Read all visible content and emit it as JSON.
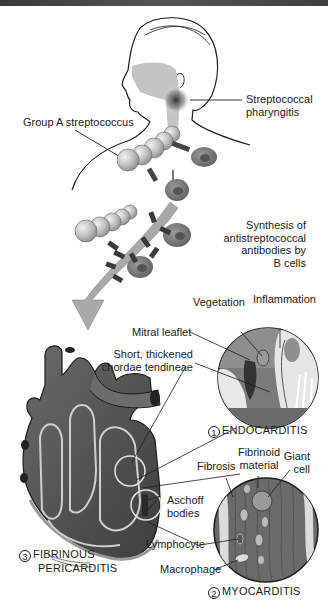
{
  "figure": {
    "topic": "Pathogenesis of rheumatic heart disease",
    "labels": {
      "strep_pharyngitis_line1": "Streptococcal",
      "strep_pharyngitis_line2": "pharyngitis",
      "group_a_strep": "Group A streptococcus",
      "synthesis_line1": "Synthesis of",
      "synthesis_line2": "antistreptococcal",
      "synthesis_line3": "antibodies by",
      "synthesis_line4": "B cells",
      "vegetation": "Vegetation",
      "inflammation": "Inflammation",
      "mitral_leaflet": "Mitral leaflet",
      "chordae_line1": "Short, thickened",
      "chordae_line2": "chordae tendineae",
      "fibrosis": "Fibrosis",
      "fibrinoid_line1": "Fibrinoid",
      "fibrinoid_line2": "material",
      "giant_line1": "Giant",
      "giant_line2": "cell",
      "aschoff_line1": "Aschoff",
      "aschoff_line2": "bodies",
      "lymphocyte": "Lymphocyte",
      "macrophage": "Macrophage"
    },
    "captions": {
      "endocarditis": {
        "number": "1",
        "text": "ENDOCARDITIS"
      },
      "myocarditis": {
        "number": "2",
        "text": "MYOCARDITIS"
      },
      "pericarditis": {
        "number": "3",
        "text_line1": "FIBRINOUS",
        "text_line2": "PERICARDITIS"
      }
    },
    "colors": {
      "background": "#ffffff",
      "tissue_dark": "#5a5a5a",
      "tissue_mid": "#8a8a8a",
      "tissue_light": "#c8c8c8",
      "arrow": "#a9a9a9",
      "line": "#1c1c1c"
    }
  }
}
